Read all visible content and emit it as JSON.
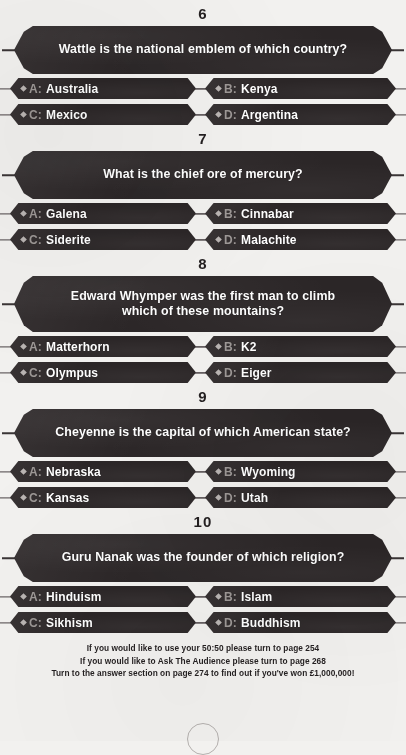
{
  "page": {
    "background_color": "#f2f1ef",
    "banner_color": "#2b2627",
    "text_color": "#ffffff",
    "letter_color": "#9d9896",
    "number_color": "#231f20"
  },
  "questions": [
    {
      "number": "6",
      "text": "Wattle is the national emblem of which country?",
      "two_line": false,
      "answers": [
        {
          "letter": "A:",
          "text": "Australia"
        },
        {
          "letter": "B:",
          "text": "Kenya"
        },
        {
          "letter": "C:",
          "text": "Mexico"
        },
        {
          "letter": "D:",
          "text": "Argentina"
        }
      ]
    },
    {
      "number": "7",
      "text": "What is the chief ore of mercury?",
      "two_line": false,
      "answers": [
        {
          "letter": "A:",
          "text": "Galena"
        },
        {
          "letter": "B:",
          "text": "Cinnabar"
        },
        {
          "letter": "C:",
          "text": "Siderite"
        },
        {
          "letter": "D:",
          "text": "Malachite"
        }
      ]
    },
    {
      "number": "8",
      "text": "Edward Whymper was the first man to climb which of these mountains?",
      "two_line": true,
      "answers": [
        {
          "letter": "A:",
          "text": "Matterhorn"
        },
        {
          "letter": "B:",
          "text": "K2"
        },
        {
          "letter": "C:",
          "text": "Olympus"
        },
        {
          "letter": "D:",
          "text": "Eiger"
        }
      ]
    },
    {
      "number": "9",
      "text": "Cheyenne is the capital of which American state?",
      "two_line": false,
      "answers": [
        {
          "letter": "A:",
          "text": "Nebraska"
        },
        {
          "letter": "B:",
          "text": "Wyoming"
        },
        {
          "letter": "C:",
          "text": "Kansas"
        },
        {
          "letter": "D:",
          "text": "Utah"
        }
      ]
    },
    {
      "number": "10",
      "text": "Guru Nanak was the founder of which religion?",
      "two_line": false,
      "answers": [
        {
          "letter": "A:",
          "text": "Hinduism"
        },
        {
          "letter": "B:",
          "text": "Islam"
        },
        {
          "letter": "C:",
          "text": "Sikhism"
        },
        {
          "letter": "D:",
          "text": "Buddhism"
        }
      ]
    }
  ],
  "footer": {
    "lines": [
      "If you would like to use your 50:50 please turn to page 254",
      "If you would like to Ask The Audience please turn to page 268",
      "Turn to the answer section on page 274 to find out if you've won £1,000,000!"
    ]
  }
}
